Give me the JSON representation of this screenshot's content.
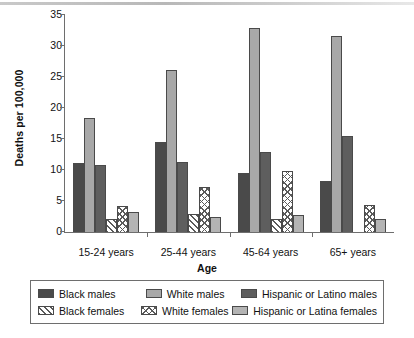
{
  "chart_data": {
    "type": "bar",
    "title": "",
    "xlabel": "Age",
    "ylabel": "Deaths per 100,000",
    "categories": [
      "15-24 years",
      "25-44 years",
      "45-64 years",
      "65+ years"
    ],
    "ylim": [
      0,
      35
    ],
    "yticks": [
      0,
      5,
      10,
      15,
      20,
      25,
      30,
      35
    ],
    "grid": false,
    "legend_position": "bottom",
    "series": [
      {
        "name": "Black males",
        "fill": "dark-gray-solid",
        "values": [
          11.1,
          14.5,
          9.4,
          8.1
        ]
      },
      {
        "name": "White males",
        "fill": "light-gray-solid",
        "values": [
          18.3,
          26.1,
          32.9,
          31.5
        ]
      },
      {
        "name": "Hispanic or Latino males",
        "fill": "medium-dark-solid",
        "values": [
          10.7,
          11.2,
          12.8,
          15.5
        ]
      },
      {
        "name": "Black females",
        "fill": "diagonal-hatch",
        "values": [
          2.0,
          2.8,
          2.1,
          0
        ]
      },
      {
        "name": "White females",
        "fill": "cross-hatch",
        "values": [
          4.2,
          7.2,
          9.8,
          4.3
        ]
      },
      {
        "name": "Hispanic or Latina females",
        "fill": "light-gray-solid",
        "values": [
          3.1,
          2.3,
          2.7,
          2.0
        ]
      }
    ]
  },
  "axis": {
    "y_title": "Deaths per 100,000",
    "x_title": "Age",
    "y_tick_labels": [
      "35",
      "30",
      "25",
      "20",
      "15",
      "10",
      "5",
      "0"
    ],
    "x_tick_labels": [
      "15-24 years",
      "25-44 years",
      "45-64 years",
      "65+ years"
    ]
  },
  "legend": {
    "row1": [
      {
        "label": "Black males"
      },
      {
        "label": "White males"
      },
      {
        "label": "Hispanic or Latino males"
      }
    ],
    "row2": [
      {
        "label": "Black females"
      },
      {
        "label": "White females"
      },
      {
        "label": "Hispanic or Latina females"
      }
    ]
  },
  "colors": {
    "black_males": "#4a4a4a",
    "white_males": "#a8a8a8",
    "hispanic_males": "#5e5e5e",
    "black_females": "#ffffff",
    "white_females": "#ffffff",
    "hispanic_females": "#b4b4b4",
    "axis": "#6e6e6e",
    "text": "#111111",
    "background": "#ffffff"
  }
}
